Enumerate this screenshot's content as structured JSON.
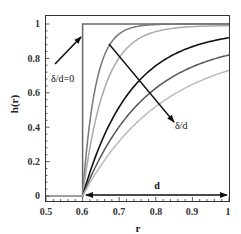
{
  "chart_data": {
    "type": "line",
    "title": "",
    "xlabel": "r",
    "ylabel": "h(r)",
    "xlim": [
      0.5,
      1.0
    ],
    "ylim": [
      0,
      1.05
    ],
    "xticks": [
      "0.5",
      "0.6",
      "0.7",
      "0.8",
      "0.9",
      "1"
    ],
    "yticks": [
      "0",
      "0.2",
      "0.4",
      "0.6",
      "0.8",
      "1"
    ],
    "grid": false,
    "x": [
      0.5,
      0.6,
      0.62,
      0.65,
      0.7,
      0.75,
      0.8,
      0.85,
      0.9,
      0.95,
      1.0
    ],
    "series": [
      {
        "name": "δ/d=0",
        "color": "#666666",
        "values": [
          0,
          0,
          1,
          1,
          1,
          1,
          1,
          1,
          1,
          1,
          1
        ]
      },
      {
        "name": "δ/d small",
        "color": "#777777",
        "values": [
          0,
          0,
          0.42,
          0.7,
          0.88,
          0.96,
          0.99,
          1.0,
          1.0,
          1.0,
          1.0
        ]
      },
      {
        "name": "δ/d 2",
        "color": "#aaaaaa",
        "values": [
          0,
          0,
          0.28,
          0.52,
          0.74,
          0.86,
          0.93,
          0.97,
          0.98,
          0.99,
          0.99
        ]
      },
      {
        "name": "δ/d 3",
        "color": "#111111",
        "values": [
          0,
          0,
          0.14,
          0.3,
          0.5,
          0.64,
          0.75,
          0.82,
          0.87,
          0.9,
          0.92
        ]
      },
      {
        "name": "δ/d 4",
        "color": "#555555",
        "values": [
          0,
          0,
          0.11,
          0.24,
          0.41,
          0.54,
          0.63,
          0.7,
          0.76,
          0.8,
          0.82
        ]
      },
      {
        "name": "δ/d 5",
        "color": "#bbbbbb",
        "values": [
          0,
          0,
          0.09,
          0.2,
          0.35,
          0.46,
          0.55,
          0.62,
          0.67,
          0.71,
          0.73
        ]
      }
    ],
    "annotations": [
      {
        "text": "δ/d=0",
        "note": "arrow pointing to step curve"
      },
      {
        "text": "δ/d",
        "note": "arrow indicating increasing δ/d across curves"
      },
      {
        "text": "d",
        "note": "double arrow spanning r from 0.6 to 1"
      }
    ]
  },
  "labels": {
    "xlabel": "r",
    "ylabel": "h(r)",
    "ann_zero": "δ/d=0",
    "ann_delta": "δ/d",
    "ann_d": "d",
    "xt0": "0.5",
    "xt1": "0.6",
    "xt2": "0.7",
    "xt3": "0.8",
    "xt4": "0.9",
    "xt5": "1",
    "yt0": "0",
    "yt1": "0.2",
    "yt2": "0.4",
    "yt3": "0.6",
    "yt4": "0.8",
    "yt5": "1"
  }
}
